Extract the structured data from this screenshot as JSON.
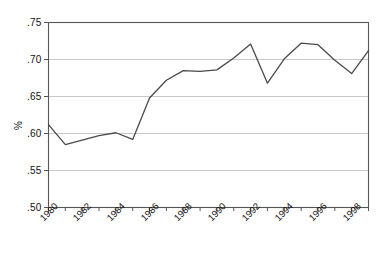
{
  "chart_data": {
    "type": "line",
    "title": "",
    "xlabel": "",
    "ylabel": "%",
    "xlim": [
      1980,
      1999
    ],
    "ylim": [
      0.5,
      0.75
    ],
    "grid": true,
    "legend": null,
    "y_ticks": [
      ".50",
      ".55",
      ".60",
      ".65",
      ".70",
      ".75"
    ],
    "y_tick_values": [
      0.5,
      0.55,
      0.6,
      0.65,
      0.7,
      0.75
    ],
    "x_ticks": [
      "1980",
      "1982",
      "1984",
      "1986",
      "1988",
      "1990",
      "1992",
      "1994",
      "1996",
      "1998"
    ],
    "x_tick_values": [
      1980,
      1982,
      1984,
      1986,
      1988,
      1990,
      1992,
      1994,
      1996,
      1998
    ],
    "x_minor_tick_values": [
      1980,
      1981,
      1982,
      1983,
      1984,
      1985,
      1986,
      1987,
      1988,
      1989,
      1990,
      1991,
      1992,
      1993,
      1994,
      1995,
      1996,
      1997,
      1998,
      1999
    ],
    "x": [
      1980,
      1981,
      1982,
      1983,
      1984,
      1985,
      1986,
      1987,
      1988,
      1989,
      1990,
      1991,
      1992,
      1993,
      1994,
      1995,
      1996,
      1997,
      1998,
      1999
    ],
    "values": [
      0.612,
      0.585,
      0.591,
      0.597,
      0.601,
      0.592,
      0.648,
      0.672,
      0.685,
      0.684,
      0.686,
      0.702,
      0.721,
      0.668,
      0.701,
      0.722,
      0.72,
      0.699,
      0.681,
      0.712
    ],
    "series": [
      {
        "name": "series-1",
        "color": "#4a4a4a",
        "values": [
          0.612,
          0.585,
          0.591,
          0.597,
          0.601,
          0.592,
          0.648,
          0.672,
          0.685,
          0.684,
          0.686,
          0.702,
          0.721,
          0.668,
          0.701,
          0.722,
          0.72,
          0.699,
          0.681,
          0.712
        ]
      }
    ]
  },
  "style": {
    "line_color": "#4a4a4a",
    "grid_color": "#c9c9c9",
    "axis_color": "#555555",
    "background": "#ffffff"
  },
  "footer": {
    "cropped_text": ""
  }
}
